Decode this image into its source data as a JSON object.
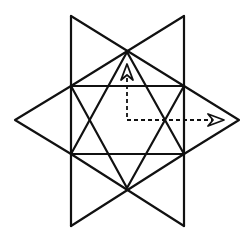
{
  "diagram": {
    "colors": {
      "line": "#111111",
      "background": "#ffffff"
    },
    "points": {
      "top_left_corner": [
        71,
        16
      ],
      "top_right_corner": [
        184,
        16
      ],
      "bottom_left_corner": [
        71,
        226
      ],
      "bottom_right_corner": [
        184,
        226
      ],
      "top_apex": [
        127,
        52
      ],
      "bottom_apex": [
        127,
        188
      ],
      "square_upper_left": [
        71,
        86
      ],
      "square_upper_right": [
        184,
        86
      ],
      "square_lower_left": [
        71,
        154
      ],
      "square_lower_right": [
        184,
        154
      ],
      "left_tip": [
        15,
        120
      ],
      "right_tip": [
        239,
        120
      ]
    },
    "dashed_path": {
      "points": [
        [
          127,
          68
        ],
        [
          127,
          120
        ],
        [
          222,
          120
        ]
      ],
      "arrows": [
        {
          "direction": "up",
          "at": [
            127,
            64
          ]
        },
        {
          "direction": "right",
          "at": [
            224,
            120
          ]
        }
      ]
    }
  }
}
